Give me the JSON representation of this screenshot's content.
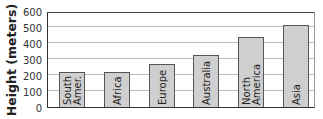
{
  "chart_data": {
    "type": "bar",
    "title": "",
    "xlabel": "",
    "ylabel": "Height (meters)",
    "ylim": [
      0,
      600
    ],
    "yticks": [
      0,
      100,
      200,
      300,
      400,
      500,
      600
    ],
    "grid": true,
    "legend": null,
    "categories": [
      "South Amer.",
      "Africa",
      "Europe",
      "Australia",
      "North America",
      "Asia"
    ],
    "category_label_lines": [
      [
        "South",
        "Amer."
      ],
      [
        "Africa"
      ],
      [
        "Europe"
      ],
      [
        "Australia"
      ],
      [
        "North",
        "America"
      ],
      [
        "Asia"
      ]
    ],
    "values": [
      220,
      220,
      270,
      325,
      440,
      510
    ],
    "bar_color": "#cfcfcf",
    "bar_edge_color": "#555555"
  }
}
